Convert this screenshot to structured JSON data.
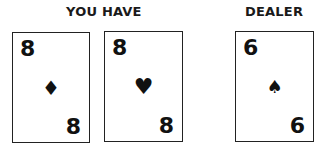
{
  "player": {
    "label": "YOU HAVE",
    "cards": [
      {
        "rank": "8",
        "suit": "♦",
        "suit_name": "diamonds"
      },
      {
        "rank": "8",
        "suit": "♥",
        "suit_name": "hearts"
      }
    ]
  },
  "dealer": {
    "label": "DEALER",
    "cards": [
      {
        "rank": "6",
        "suit": "♠",
        "suit_name": "spades"
      }
    ]
  }
}
